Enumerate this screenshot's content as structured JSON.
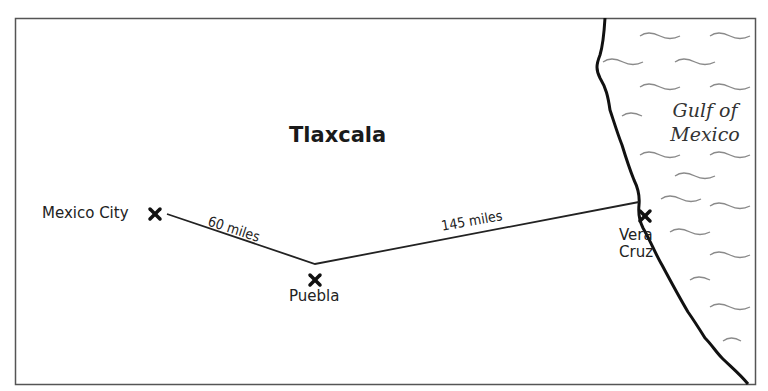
{
  "map": {
    "region_label": "Tlaxcala",
    "sea_label_line1": "Gulf of",
    "sea_label_line2": "Mexico",
    "cities": [
      {
        "name": "Mexico City",
        "marker": "x-marker"
      },
      {
        "name": "Puebla",
        "marker": "x-marker"
      },
      {
        "name_line1": "Vera",
        "name_line2": "Cruz",
        "marker": "x-marker"
      }
    ],
    "routes": [
      {
        "from": "Mexico City",
        "to": "Puebla",
        "label": "60 miles"
      },
      {
        "from": "Puebla",
        "to": "Vera Cruz",
        "label": "145 miles"
      }
    ],
    "colors": {
      "border": "#555555",
      "route": "#222222",
      "coastline": "#111111",
      "waves": "#888888"
    }
  }
}
